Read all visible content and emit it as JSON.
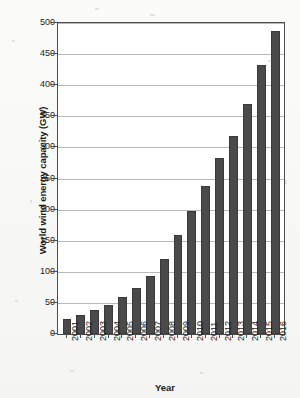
{
  "chart_data": {
    "type": "bar",
    "title": "",
    "xlabel": "Year",
    "ylabel": "World wind energy capacity (GW)",
    "categories": [
      "2001",
      "2002",
      "2003",
      "2004",
      "2005",
      "2006",
      "2007",
      "2008",
      "2009",
      "2010",
      "2011",
      "2012",
      "2013",
      "2014",
      "2015",
      "2016"
    ],
    "values": [
      24,
      31,
      39,
      47,
      59,
      74,
      94,
      121,
      159,
      198,
      238,
      283,
      318,
      370,
      433,
      487
    ],
    "ylim": [
      0,
      500
    ],
    "yticks": [
      0,
      50,
      100,
      150,
      200,
      250,
      300,
      350,
      400,
      450,
      500
    ],
    "ytick_labels": [
      "0",
      "50",
      "100",
      "150",
      "200",
      "250",
      "300",
      "350",
      "400",
      "450",
      "500"
    ],
    "grid": true,
    "legend": "none",
    "bar_color": "#4a4a4a",
    "grid_color": "#b9b9b9",
    "axis_color": "#4d4d4d",
    "background": "#ffffff"
  }
}
